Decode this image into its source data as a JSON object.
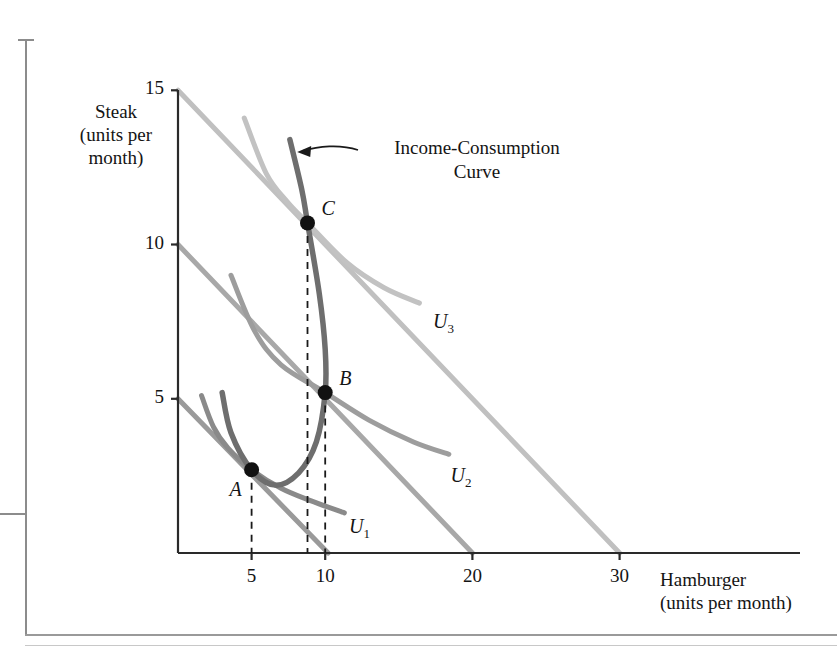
{
  "figure": {
    "kind": "economics-indifference-curve-diagram",
    "annotation": {
      "line1": "Income-Consumption",
      "line2": "Curve"
    }
  },
  "axes": {
    "y": {
      "title": "Steak\n(units per\nmonth)",
      "ticks": [
        5,
        10,
        15
      ]
    },
    "x": {
      "title": "Hamburger\n(units per month)",
      "ticks": [
        5,
        10,
        20,
        30
      ]
    }
  },
  "points": [
    {
      "id": "A",
      "label": "A",
      "x": 5,
      "y": 2.7
    },
    {
      "id": "B",
      "label": "B",
      "x": 10,
      "y": 5.2
    },
    {
      "id": "C",
      "label": "C",
      "x": 8.8,
      "y": 10.7
    }
  ],
  "curve_labels": [
    {
      "id": "U1",
      "base": "U",
      "sub": "1"
    },
    {
      "id": "U2",
      "base": "U",
      "sub": "2"
    },
    {
      "id": "U3",
      "base": "U",
      "sub": "3"
    }
  ],
  "colors": {
    "indifference_light": "#c0c0c0",
    "indifference_mid": "#9a9a9a",
    "indifference_dark": "#808080",
    "budget_line": "#8e8e8e",
    "income_consumption_curve": "#6e6e6e",
    "axis": "#2a2a2a",
    "dashed": "#1a1a1a",
    "point_fill": "#111111",
    "page_rule": "#8c8c8c"
  },
  "chart_data": {
    "type": "line",
    "title": "",
    "xlabel": "Hamburger (units per month)",
    "ylabel": "Steak (units per month)",
    "xlim": [
      0,
      34
    ],
    "ylim": [
      0,
      16
    ],
    "xticks": [
      5,
      10,
      20,
      30
    ],
    "yticks": [
      5,
      10,
      15
    ],
    "grid": false,
    "legend": "inline-labels",
    "annotations": [
      {
        "text": "Income-Consumption Curve",
        "points_to": {
          "x": 8.1,
          "y": 13.0
        },
        "text_at": {
          "x": 13.5,
          "y": 13.4
        }
      }
    ],
    "series": [
      {
        "name": "Budget line 1",
        "type": "line",
        "color": "#9a9a9a",
        "points": [
          [
            0,
            5.0
          ],
          [
            10.2,
            0.0
          ]
        ]
      },
      {
        "name": "Budget line 2",
        "type": "line",
        "color": "#a8a8a8",
        "points": [
          [
            0,
            10.0
          ],
          [
            20.0,
            0.0
          ]
        ]
      },
      {
        "name": "Budget line 3",
        "type": "line",
        "color": "#c0c0c0",
        "points": [
          [
            0,
            15.0
          ],
          [
            30.0,
            0.0
          ]
        ]
      },
      {
        "name": "U1",
        "type": "indifference-curve",
        "color": "#8a8a8a",
        "label": "U1",
        "label_at": {
          "x": 12.3,
          "y": 0.75
        },
        "points": [
          [
            1.6,
            5.1
          ],
          [
            2.4,
            4.1
          ],
          [
            3.4,
            3.4
          ],
          [
            5.0,
            2.7
          ],
          [
            7.0,
            2.1
          ],
          [
            9.0,
            1.7
          ],
          [
            11.3,
            1.3
          ]
        ]
      },
      {
        "name": "U2",
        "type": "indifference-curve",
        "color": "#9d9d9d",
        "label": "U2",
        "label_at": {
          "x": 19.2,
          "y": 2.4
        },
        "points": [
          [
            3.6,
            9.0
          ],
          [
            5.2,
            7.2
          ],
          [
            7.0,
            6.1
          ],
          [
            10.0,
            5.2
          ],
          [
            13.0,
            4.3
          ],
          [
            16.0,
            3.6
          ],
          [
            18.4,
            3.2
          ]
        ]
      },
      {
        "name": "U3",
        "type": "indifference-curve",
        "color": "#c2c2c2",
        "label": "U3",
        "label_at": {
          "x": 18.0,
          "y": 7.4
        },
        "points": [
          [
            4.5,
            14.1
          ],
          [
            6.0,
            12.3
          ],
          [
            7.4,
            11.4
          ],
          [
            8.8,
            10.7
          ],
          [
            11.5,
            9.4
          ],
          [
            14.0,
            8.6
          ],
          [
            16.4,
            8.1
          ]
        ]
      },
      {
        "name": "Income-Consumption Curve",
        "type": "income-consumption-curve",
        "color": "#6e6e6e",
        "points": [
          [
            7.6,
            13.4
          ],
          [
            8.4,
            11.8
          ],
          [
            8.8,
            10.7
          ],
          [
            9.6,
            8.4
          ],
          [
            10.0,
            6.6
          ],
          [
            10.0,
            5.2
          ],
          [
            9.4,
            3.6
          ],
          [
            8.2,
            2.6
          ],
          [
            6.6,
            2.2
          ],
          [
            5.0,
            2.7
          ],
          [
            3.6,
            3.9
          ],
          [
            3.0,
            5.2
          ]
        ]
      }
    ],
    "equilibrium_points": [
      {
        "label": "A",
        "x": 5.0,
        "y": 2.7
      },
      {
        "label": "B",
        "x": 10.0,
        "y": 5.2
      },
      {
        "label": "C",
        "x": 8.8,
        "y": 10.7
      }
    ],
    "dropline_x_values": [
      5.0,
      8.8,
      10.0
    ]
  }
}
